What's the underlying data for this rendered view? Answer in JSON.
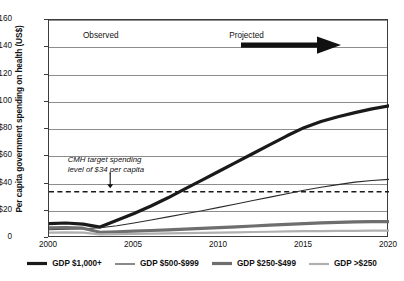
{
  "chart_data": {
    "type": "line",
    "title": "",
    "xlabel": "",
    "ylabel": "Per capita government spending on health (US$)",
    "xlim": [
      2000,
      2020
    ],
    "ylim": [
      0,
      160
    ],
    "grid": true,
    "legend_position": "bottom",
    "x": [
      2000,
      2001,
      2002,
      2003,
      2004,
      2005,
      2006,
      2007,
      2008,
      2009,
      2010,
      2011,
      2012,
      2013,
      2014,
      2015,
      2016,
      2017,
      2018,
      2019,
      2020
    ],
    "yticks": [
      "0",
      "$20",
      "$40",
      "$60",
      "$80",
      "$100",
      "$120",
      "$140",
      "$160"
    ],
    "ytick_values": [
      0,
      20,
      40,
      60,
      80,
      100,
      120,
      140,
      160
    ],
    "xticks": [
      "2000",
      "2005",
      "2010",
      "2015",
      "2020"
    ],
    "xtick_values": [
      2000,
      2005,
      2010,
      2015,
      2020
    ],
    "series": [
      {
        "name": "GDP $1,000+",
        "style": "thick-black",
        "color": "#1a1a1a",
        "width": 3.2,
        "values": [
          10.5,
          11.0,
          10.2,
          8.0,
          13.0,
          18.0,
          23.5,
          29.5,
          36.0,
          42.5,
          49.0,
          55.5,
          62.0,
          68.5,
          75.0,
          81.0,
          85.5,
          89.0,
          92.0,
          94.8,
          97.0
        ]
      },
      {
        "name": "GDP $500-$999",
        "style": "thin-black",
        "color": "#2b2b2b",
        "width": 1.1,
        "values": [
          6.0,
          6.5,
          6.8,
          7.5,
          9.0,
          11.0,
          13.2,
          15.5,
          17.8,
          20.0,
          22.5,
          25.0,
          27.5,
          30.0,
          32.5,
          35.0,
          37.2,
          39.2,
          41.0,
          42.2,
          43.0
        ]
      },
      {
        "name": "GDP $250-$499",
        "style": "thick-gray",
        "color": "#6e6e6e",
        "width": 3.2,
        "values": [
          7.5,
          7.6,
          7.2,
          4.2,
          4.6,
          5.0,
          5.5,
          6.0,
          6.5,
          7.0,
          7.6,
          8.2,
          8.8,
          9.4,
          10.0,
          10.6,
          11.1,
          11.5,
          11.8,
          12.0,
          12.0
        ]
      },
      {
        "name": "GDP >$250",
        "style": "thin-gray",
        "color": "#b0b0b0",
        "width": 2.2,
        "values": [
          4.0,
          4.1,
          3.9,
          2.6,
          2.8,
          3.0,
          3.2,
          3.4,
          3.6,
          3.8,
          4.0,
          4.2,
          4.4,
          4.6,
          4.8,
          5.0,
          5.1,
          5.2,
          5.3,
          5.4,
          5.4
        ]
      }
    ],
    "reference_line": {
      "label": "CMH target spending level of $34 per capita",
      "value": 34,
      "style": "dashed",
      "color": "#1a1a1a"
    },
    "annotations": [
      {
        "name": "observed",
        "text": "Observed",
        "x": 2002.0,
        "y": 148
      },
      {
        "name": "projected",
        "text": "Projected",
        "x": 2010.6,
        "y": 148
      }
    ]
  },
  "legend": {
    "items": [
      {
        "label": "GDP $1,000+"
      },
      {
        "label": "GDP $500-$999"
      },
      {
        "label": "GDP $250-$499"
      },
      {
        "label": "GDP >$250"
      }
    ]
  },
  "annotations": {
    "cmh_line1": "CMH target spending",
    "cmh_line2": "level of $34 per capita"
  }
}
